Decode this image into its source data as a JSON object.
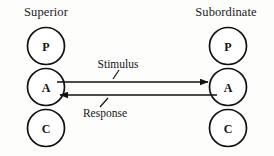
{
  "diagram": {
    "title_left": "Superior",
    "title_right": "Subordinate",
    "left_nodes": [
      {
        "letter": "P",
        "name": "parent"
      },
      {
        "letter": "A",
        "name": "adult"
      },
      {
        "letter": "C",
        "name": "child"
      }
    ],
    "right_nodes": [
      {
        "letter": "P",
        "name": "parent"
      },
      {
        "letter": "A",
        "name": "adult"
      },
      {
        "letter": "C",
        "name": "child"
      }
    ],
    "edges": [
      {
        "label": "Stimulus",
        "direction": "left-to-right",
        "from": "Superior.A",
        "to": "Subordinate.A"
      },
      {
        "label": "Response",
        "direction": "right-to-left",
        "from": "Subordinate.A",
        "to": "Superior.A"
      }
    ],
    "colors": {
      "background": "#fdfdfc",
      "ink": "#111111",
      "node_fill": "#ffffff"
    }
  }
}
